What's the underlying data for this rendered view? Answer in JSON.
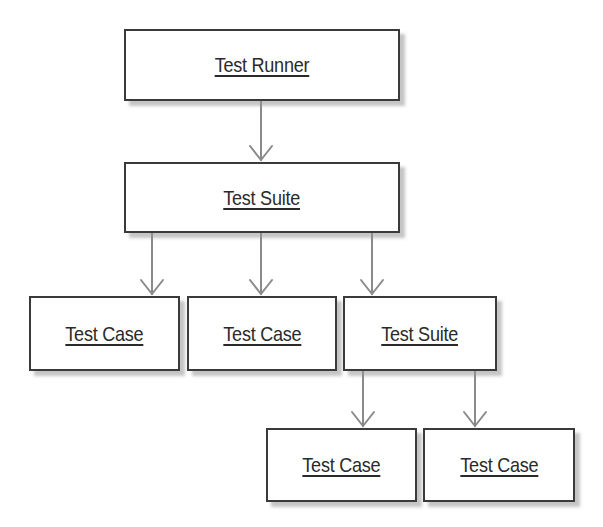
{
  "diagram": {
    "type": "hierarchy",
    "colors": {
      "border": "#3a3a3a",
      "arrow": "#8a8a8a",
      "text": "#2a2a2a",
      "background": "#ffffff"
    },
    "nodes": {
      "runner": {
        "label": "Test Runner",
        "x": 124,
        "y": 29,
        "w": 276,
        "h": 72
      },
      "suite": {
        "label": "Test Suite",
        "x": 124,
        "y": 162,
        "w": 276,
        "h": 71
      },
      "case1": {
        "label": "Test Case",
        "x": 29,
        "y": 296,
        "w": 151,
        "h": 75
      },
      "case2": {
        "label": "Test Case",
        "x": 187,
        "y": 296,
        "w": 150,
        "h": 75
      },
      "suite2": {
        "label": "Test Suite",
        "x": 343,
        "y": 296,
        "w": 154,
        "h": 75
      },
      "case3": {
        "label": "Test Case",
        "x": 266,
        "y": 428,
        "w": 151,
        "h": 74
      },
      "case4": {
        "label": "Test Case",
        "x": 423,
        "y": 428,
        "w": 152,
        "h": 74
      }
    },
    "edges": [
      {
        "from": "runner",
        "to": "suite",
        "x": 261,
        "y1": 101,
        "y2": 161
      },
      {
        "from": "suite",
        "to": "case1",
        "x": 152,
        "y1": 233,
        "y2": 295
      },
      {
        "from": "suite",
        "to": "case2",
        "x": 261,
        "y1": 233,
        "y2": 295
      },
      {
        "from": "suite",
        "to": "suite2",
        "x": 372,
        "y1": 233,
        "y2": 295
      },
      {
        "from": "suite2",
        "to": "case3",
        "x": 363,
        "y1": 371,
        "y2": 427
      },
      {
        "from": "suite2",
        "to": "case4",
        "x": 475,
        "y1": 371,
        "y2": 427
      }
    ]
  }
}
